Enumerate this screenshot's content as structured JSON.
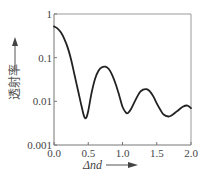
{
  "chart_data": {
    "type": "line",
    "title": "",
    "xlabel": "Δnd",
    "ylabel": "透射率",
    "xlim": [
      0.0,
      2.0
    ],
    "ylim": [
      0.001,
      1
    ],
    "yscale": "log",
    "grid": false,
    "legend": null,
    "x_ticks": [
      "0.0",
      "0.5",
      "1.0",
      "1.5",
      "2.0"
    ],
    "y_ticks": [
      "1",
      "0.1",
      "0.01",
      "0.001"
    ],
    "series": [
      {
        "name": "transmittance",
        "x": [
          0.0,
          0.05,
          0.1,
          0.15,
          0.2,
          0.25,
          0.3,
          0.35,
          0.4,
          0.44,
          0.47,
          0.5,
          0.55,
          0.6,
          0.65,
          0.7,
          0.75,
          0.8,
          0.85,
          0.9,
          0.95,
          1.0,
          1.05,
          1.08,
          1.12,
          1.18,
          1.25,
          1.3,
          1.35,
          1.4,
          1.45,
          1.5,
          1.55,
          1.6,
          1.67,
          1.72,
          1.8,
          1.88,
          1.95,
          2.0
        ],
        "values": [
          0.52,
          0.47,
          0.38,
          0.27,
          0.17,
          0.09,
          0.04,
          0.018,
          0.008,
          0.0045,
          0.0042,
          0.006,
          0.016,
          0.033,
          0.05,
          0.06,
          0.062,
          0.055,
          0.04,
          0.025,
          0.014,
          0.0075,
          0.0055,
          0.0054,
          0.0065,
          0.01,
          0.016,
          0.0185,
          0.019,
          0.017,
          0.013,
          0.009,
          0.0065,
          0.005,
          0.0045,
          0.0048,
          0.006,
          0.0075,
          0.008,
          0.007
        ]
      }
    ]
  },
  "labels": {
    "x_axis": "Δnd",
    "y_axis": "透射率"
  }
}
